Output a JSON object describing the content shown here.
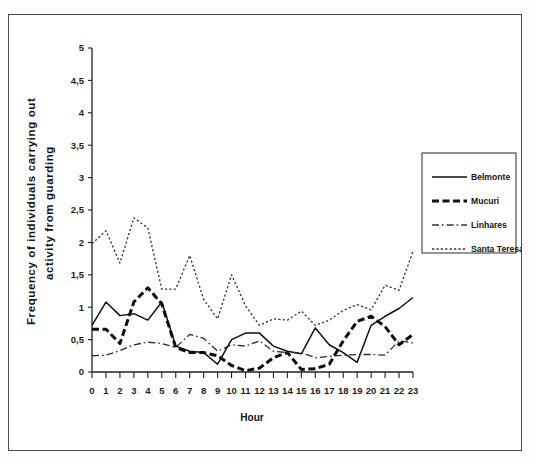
{
  "figure": {
    "x_axis_title": "Hour",
    "y_axis_title_line1": "Frequency of individuals carrying out",
    "y_axis_title_line2": "activity from guarding",
    "y_tick_labels": [
      "0",
      "0,5",
      "1",
      "1,5",
      "2",
      "2,5",
      "3",
      "3,5",
      "4",
      "4,5",
      "5"
    ],
    "x_tick_labels": [
      "0",
      "1",
      "2",
      "3",
      "4",
      "5",
      "6",
      "7",
      "8",
      "9",
      "10",
      "11",
      "12",
      "13",
      "14",
      "15",
      "16",
      "17",
      "18",
      "19",
      "20",
      "21",
      "22",
      "23"
    ],
    "legend": {
      "items": [
        {
          "label": "Belmonte",
          "style": "solid",
          "color": "#111111"
        },
        {
          "label": "Mucuri",
          "style": "dash-dot-thick",
          "color": "#111111"
        },
        {
          "label": "Linhares",
          "style": "dash-dot-thin",
          "color": "#333333"
        },
        {
          "label": "Santa Teresa",
          "style": "dotted",
          "color": "#333333"
        }
      ]
    }
  },
  "chart_data": {
    "type": "line",
    "title": "",
    "subtitle": "",
    "xlabel": "Hour",
    "ylabel": "Frequency of individuals carrying out activity from guarding",
    "xlim": [
      0,
      23
    ],
    "ylim": [
      0,
      5
    ],
    "ytick_step": 0.5,
    "grid": false,
    "legend_position": "right",
    "decimal_separator": ",",
    "x": [
      0,
      1,
      2,
      3,
      4,
      5,
      6,
      7,
      8,
      9,
      10,
      11,
      12,
      13,
      14,
      15,
      16,
      17,
      18,
      19,
      20,
      21,
      22,
      23
    ],
    "series": [
      {
        "name": "Belmonte",
        "style": "solid",
        "values": [
          0.72,
          1.08,
          0.87,
          0.9,
          0.8,
          1.08,
          0.4,
          0.32,
          0.3,
          0.12,
          0.5,
          0.6,
          0.6,
          0.4,
          0.32,
          0.28,
          0.68,
          0.42,
          0.3,
          0.15,
          0.72,
          0.86,
          0.98,
          1.15
        ]
      },
      {
        "name": "Mucuri",
        "style": "dash-dot-thick",
        "values": [
          0.66,
          0.66,
          0.44,
          1.08,
          1.3,
          1.05,
          0.38,
          0.3,
          0.3,
          0.25,
          0.1,
          0.02,
          0.06,
          0.22,
          0.3,
          0.04,
          0.05,
          0.12,
          0.48,
          0.78,
          0.86,
          0.7,
          0.42,
          0.58
        ]
      },
      {
        "name": "Linhares",
        "style": "dash-dot-thin",
        "values": [
          0.25,
          0.26,
          0.33,
          0.42,
          0.46,
          0.44,
          0.38,
          0.58,
          0.52,
          0.32,
          0.42,
          0.4,
          0.48,
          0.32,
          0.3,
          0.3,
          0.22,
          0.24,
          0.26,
          0.27,
          0.27,
          0.26,
          0.48,
          0.45
        ]
      },
      {
        "name": "Santa Teresa",
        "style": "dotted",
        "values": [
          1.98,
          2.18,
          1.68,
          2.38,
          2.22,
          1.28,
          1.28,
          1.8,
          1.12,
          0.82,
          1.5,
          1.02,
          0.72,
          0.82,
          0.8,
          0.94,
          0.72,
          0.8,
          0.95,
          1.04,
          0.96,
          1.34,
          1.26,
          1.86
        ]
      }
    ]
  }
}
